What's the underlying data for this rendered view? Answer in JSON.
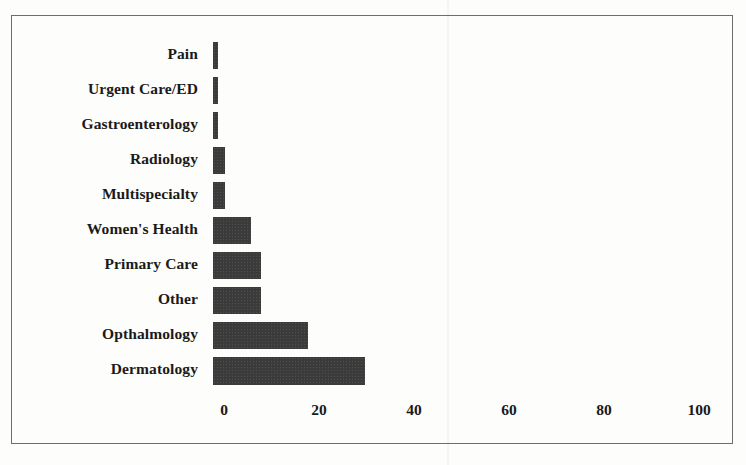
{
  "chart_data": {
    "type": "bar",
    "orientation": "horizontal",
    "title": "",
    "xlabel": "",
    "ylabel": "",
    "xlim": [
      0,
      100
    ],
    "xticks": [
      0,
      20,
      40,
      60,
      80,
      100
    ],
    "xtick_labels": [
      "0",
      "20",
      "40",
      "60",
      "80",
      "100"
    ],
    "grid": false,
    "legend": false,
    "bar_color": "#3b3b3b",
    "frame_color": "#6d6d6d",
    "categories": [
      "Pain",
      "Urgent Care/ED",
      "Gastroenterology",
      "Radiology",
      "Multispecialty",
      "Women's Health",
      "Primary Care",
      "Other",
      "Opthalmology",
      "Dermatology"
    ],
    "values": [
      1,
      1,
      1,
      2.5,
      2.5,
      8,
      10,
      10,
      20,
      32
    ],
    "series": [
      {
        "name": "Specialty",
        "values": [
          1,
          1,
          1,
          2.5,
          2.5,
          8,
          10,
          10,
          20,
          32
        ]
      }
    ]
  }
}
